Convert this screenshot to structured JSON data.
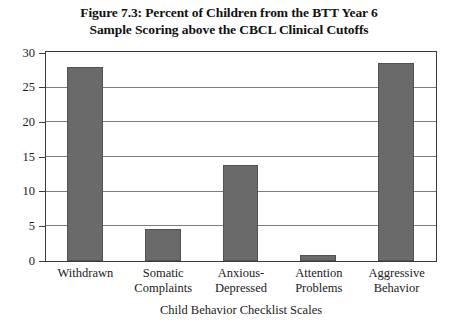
{
  "chart_data": {
    "type": "bar",
    "title": "Figure 7.3: Percent of Children from the BTT Year 6 Sample Scoring above the CBCL Clinical Cutoffs",
    "title_lines": [
      "Figure 7.3: Percent of Children from the BTT Year 6",
      "Sample Scoring above the CBCL Clinical Cutoffs"
    ],
    "categories": [
      "Withdrawn",
      "Somatic Complaints",
      "Anxious-Depressed",
      "Attention Problems",
      "Aggressive Behavior"
    ],
    "category_lines": [
      [
        "Withdrawn"
      ],
      [
        "Somatic",
        "Complaints"
      ],
      [
        "Anxious-",
        "Depressed"
      ],
      [
        "Attention",
        "Problems"
      ],
      [
        "Aggressive",
        "Behavior"
      ]
    ],
    "values": [
      28.0,
      4.6,
      13.8,
      0.9,
      28.6
    ],
    "xlabel": "Child Behavior Checklist Scales",
    "ylabel": "",
    "ylim": [
      0,
      30
    ],
    "ytick_step": 5,
    "yticks": [
      0,
      5,
      10,
      15,
      20,
      25,
      30
    ],
    "ytick_labels": [
      "0",
      "5",
      "10",
      "15",
      "20",
      "25",
      "30"
    ],
    "grid": true,
    "legend": null,
    "bar_color": "#6a6a6a",
    "bar_edge_color": "#525252",
    "frame_color": "#3a3a3a",
    "grid_color": "#7d7d7d",
    "background_color": "#ffffff"
  }
}
